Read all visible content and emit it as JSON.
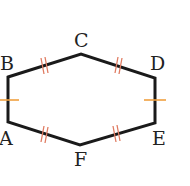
{
  "diagram": {
    "type": "hexagon",
    "vertices": [
      {
        "name": "A",
        "label": "A"
      },
      {
        "name": "B",
        "label": "B"
      },
      {
        "name": "C",
        "label": "C"
      },
      {
        "name": "D",
        "label": "D"
      },
      {
        "name": "E",
        "label": "E"
      },
      {
        "name": "F",
        "label": "F"
      }
    ],
    "congruence_marks": {
      "single_tick_sides": [
        "AB",
        "DE"
      ],
      "double_tick_sides": [
        "BC",
        "CD",
        "EF",
        "FA"
      ]
    },
    "colors": {
      "stroke": "#1a1a1a",
      "single_tick": "#f0a040",
      "double_tick": "#e07a60",
      "label": "#222222"
    }
  }
}
